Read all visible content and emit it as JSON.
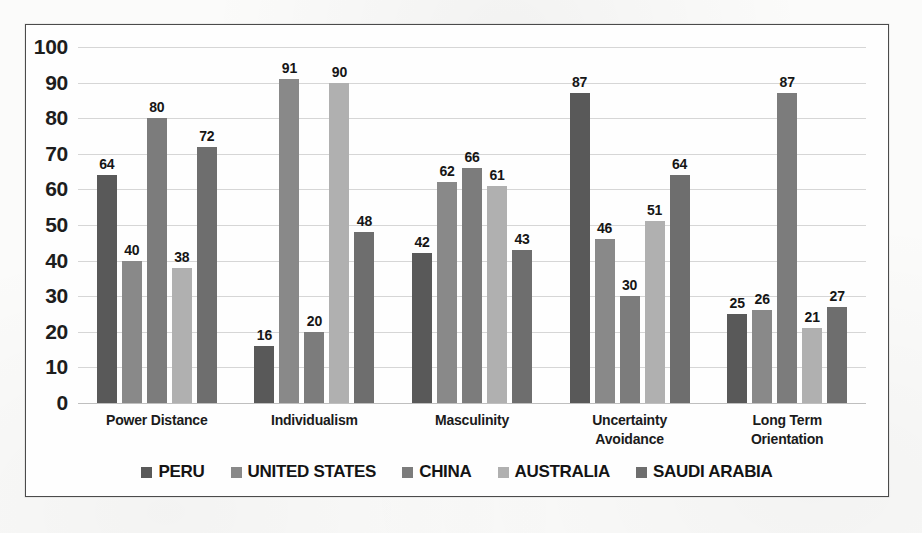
{
  "chart_data": {
    "type": "bar",
    "title": "",
    "xlabel": "",
    "ylabel": "",
    "ylim": [
      0,
      100
    ],
    "ytick_step": 10,
    "yticks": [
      "100",
      "90",
      "80",
      "70",
      "60",
      "50",
      "40",
      "30",
      "20",
      "10",
      "0"
    ],
    "grid": true,
    "legend_position": "bottom",
    "categories": [
      "Power Distance",
      "Individualism",
      "Masculinity",
      "Uncertainty\nAvoidance",
      "Long Term\nOrientation"
    ],
    "category_lines": [
      [
        "Power Distance"
      ],
      [
        "Individualism"
      ],
      [
        "Masculinity"
      ],
      [
        "Uncertainty",
        "Avoidance"
      ],
      [
        "Long Term",
        "Orientation"
      ]
    ],
    "series": [
      {
        "name": "PERU",
        "color": "#595959",
        "values": [
          64,
          16,
          42,
          87,
          25
        ]
      },
      {
        "name": "UNITED STATES",
        "color": "#898989",
        "values": [
          40,
          91,
          62,
          46,
          26
        ]
      },
      {
        "name": "CHINA",
        "color": "#7c7c7c",
        "values": [
          80,
          20,
          66,
          30,
          87
        ]
      },
      {
        "name": "AUSTRALIA",
        "color": "#b0b0b0",
        "values": [
          38,
          90,
          61,
          51,
          21
        ]
      },
      {
        "name": "SAUDI ARABIA",
        "color": "#6e6e6e",
        "values": [
          72,
          48,
          43,
          64,
          27
        ]
      }
    ]
  },
  "frame": {
    "border_color": "#4b4b4b",
    "background": "#fefefe"
  }
}
